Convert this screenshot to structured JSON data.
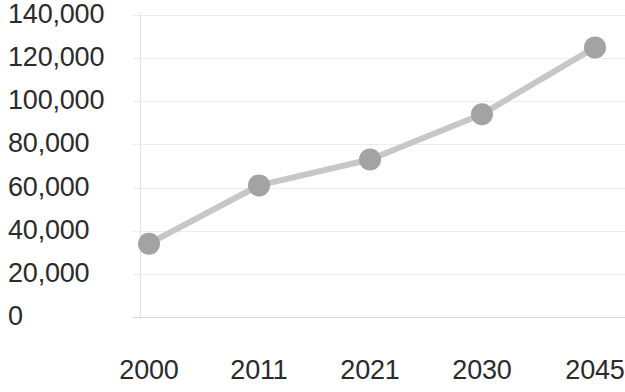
{
  "chart_data": {
    "type": "line",
    "title": "",
    "subtitle": "",
    "xlabel": "",
    "ylabel": "",
    "categories": [
      "2000",
      "2011",
      "2021",
      "2030",
      "2045"
    ],
    "values": [
      34000,
      61000,
      73000,
      94000,
      125000
    ],
    "series": [
      {
        "name": "",
        "values": [
          34000,
          61000,
          73000,
          94000,
          125000
        ]
      }
    ],
    "ylim": [
      0,
      140000
    ],
    "y_ticks": [
      0,
      20000,
      40000,
      60000,
      80000,
      100000,
      120000,
      140000
    ],
    "y_tick_labels": [
      "0",
      "20,000",
      "40,000",
      "60,000",
      "80,000",
      "100,000",
      "120,000",
      "140,000"
    ],
    "grid": true,
    "grid_axis": "y",
    "legend": false,
    "legend_position": "none",
    "markers": true,
    "colors": {
      "line": "#c7c7c7",
      "marker": "#a3a3a3",
      "gridline": "#ededed",
      "axis": "#d9d9d9",
      "tick_text": "#2b2b2b",
      "background": "#ffffff"
    }
  },
  "axes": {
    "y_labels": [
      {
        "text": "140,000",
        "value": 140000
      },
      {
        "text": "120,000",
        "value": 120000
      },
      {
        "text": "100,000",
        "value": 100000
      },
      {
        "text": "80,000",
        "value": 80000
      },
      {
        "text": "60,000",
        "value": 60000
      },
      {
        "text": "40,000",
        "value": 40000
      },
      {
        "text": "20,000",
        "value": 20000
      },
      {
        "text": "0",
        "value": 0
      }
    ],
    "x_labels": [
      {
        "text": "2000"
      },
      {
        "text": "2011"
      },
      {
        "text": "2021"
      },
      {
        "text": "2030"
      },
      {
        "text": "2045"
      }
    ]
  }
}
